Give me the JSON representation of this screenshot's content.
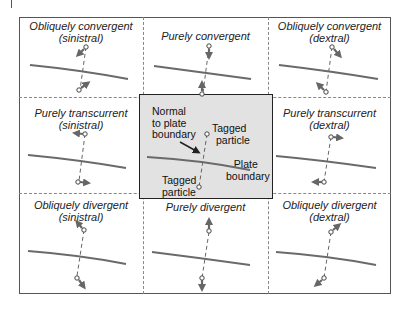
{
  "colors": {
    "boundary_line": "#6a6a6a",
    "arrow": "#666666",
    "center_fill": "#e2e2e2",
    "grid_dashed": "#888888",
    "outer_border": "#555555"
  },
  "cells": [
    {
      "id": "tl",
      "title": "Obliquely convergent",
      "subtitle": "(sinistral)"
    },
    {
      "id": "tc",
      "title": "Purely convergent",
      "subtitle": ""
    },
    {
      "id": "tr",
      "title": "Obliquely convergent",
      "subtitle": "(dextral)"
    },
    {
      "id": "ml",
      "title": "Purely transcurrent",
      "subtitle": "(sinistral)"
    },
    {
      "id": "mr",
      "title": "Purely transcurrent",
      "subtitle": "(dextral)"
    },
    {
      "id": "bl",
      "title": "Obliquely divergent",
      "subtitle": "(sinistral)"
    },
    {
      "id": "bc",
      "title": "Purely divergent",
      "subtitle": ""
    },
    {
      "id": "br",
      "title": "Obliquely divergent",
      "subtitle": "(dextral)"
    }
  ],
  "center": {
    "normal_label_1": "Normal",
    "normal_label_2": "to plate",
    "normal_label_3": "boundary",
    "tagged_top_1": "Tagged",
    "tagged_top_2": "particle",
    "plate_label_1": "Plate",
    "plate_label_2": "boundary",
    "tagged_bottom_1": "Tagged",
    "tagged_bottom_2": "particle"
  }
}
